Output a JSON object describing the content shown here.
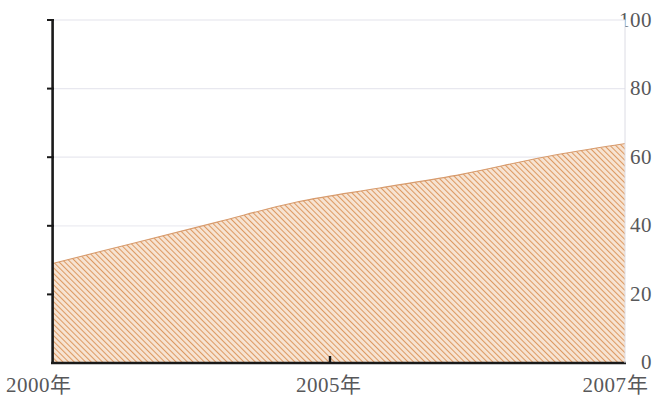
{
  "chart_data": {
    "type": "area",
    "title": "",
    "subtitle": "",
    "xlabel": "",
    "ylabel": "",
    "x": [
      2000,
      2001,
      2002,
      2003,
      2004,
      2005,
      2006,
      2007
    ],
    "categories": [
      "2000",
      "2001",
      "2002",
      "2003",
      "2004",
      "2005",
      "2006",
      "2007"
    ],
    "series": [
      {
        "name": "",
        "values": [
          29,
          35,
          41,
          47,
          51,
          55,
          60,
          64
        ]
      }
    ],
    "values": [
      29,
      35,
      41,
      47,
      51,
      55,
      60,
      64
    ],
    "xlim": [
      2000,
      2007
    ],
    "ylim": [
      0,
      100
    ],
    "yticks": [
      0,
      20,
      40,
      60,
      80,
      100
    ],
    "ytick_labels": [
      "0",
      "20",
      "40",
      "60",
      "80",
      "100"
    ],
    "xticks": [
      2000,
      2005,
      2007
    ],
    "xtick_labels": [
      "2000年",
      "2005年",
      "2007年"
    ],
    "grid": true,
    "grid_axis": "y",
    "legend": false,
    "legend_position": "none",
    "fill_style": "diagonal-hatch",
    "colors": {
      "area_fill": "#e8bb94",
      "hatch_line": "#d98e52",
      "axis_line": "#1a1a1a",
      "gridline": "#e8e8ee",
      "tick_text": "#58585a",
      "plot_background": "#ffffff"
    },
    "annotations": []
  },
  "axes": {
    "y": {
      "ticks": [
        {
          "label": "100",
          "value": 100
        },
        {
          "label": "80",
          "value": 80
        },
        {
          "label": "60",
          "value": 60
        },
        {
          "label": "40",
          "value": 40
        },
        {
          "label": "20",
          "value": 20
        },
        {
          "label": "0",
          "value": 0
        }
      ]
    },
    "x": {
      "ticks": [
        {
          "label": "2000年",
          "value": 2000
        },
        {
          "label": "2005年",
          "value": 2005
        },
        {
          "label": "2007年",
          "value": 2007
        }
      ]
    }
  }
}
